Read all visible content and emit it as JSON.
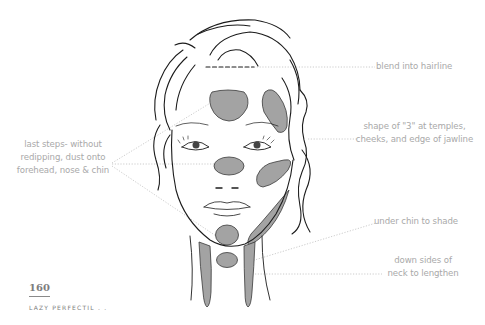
{
  "illustration": {
    "subject": "face-contour-diagram",
    "shade_color": "#a3a3a3",
    "line_color": "#1c1c1c",
    "leader_color": "#c4c4c4"
  },
  "annotations": {
    "left": {
      "lines": [
        "last steps- without",
        "redipping, dust onto",
        "forehead, nose & chin"
      ]
    },
    "right": [
      {
        "lines": [
          "blend into hairline"
        ]
      },
      {
        "lines": [
          "shape of \"3\" at temples,",
          "cheeks, and edge of jawline"
        ]
      },
      {
        "lines": [
          "under chin to shade"
        ]
      },
      {
        "lines": [
          "down sides of",
          "neck to lengthen"
        ]
      }
    ]
  },
  "footer": {
    "page_number": "160",
    "running_head": "LAZY PERFECTIL . ."
  }
}
